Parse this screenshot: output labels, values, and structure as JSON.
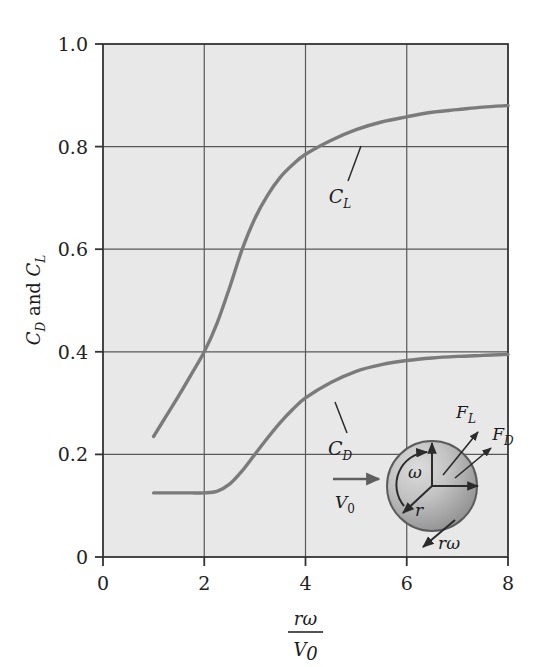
{
  "figure": {
    "background_color": "#ffffff",
    "plot_fill_color": "#e8e8e8",
    "axis_color": "#3a3a3a",
    "grid_color": "#4a4a4a",
    "curve_color": "#7a7a7a",
    "text_color": "#1a1a1a"
  },
  "axes": {
    "y_label_parts": {
      "c": "C",
      "d_sub": "D",
      "and": " and ",
      "c2": "C",
      "l_sub": "L"
    },
    "y_label_text": "CD and CL",
    "x_label_numerator": "rω",
    "x_label_denominator": "V",
    "x_label_denominator_sub": "0",
    "x_label_text": "rω / V0",
    "x_ticks": [
      "0",
      "2",
      "4",
      "6",
      "8"
    ],
    "x_tick_values": [
      0,
      2,
      4,
      6,
      8
    ],
    "y_ticks": [
      "0",
      "0.2",
      "0.4",
      "0.6",
      "0.8",
      "1.0"
    ],
    "y_tick_values": [
      0,
      0.2,
      0.4,
      0.6,
      0.8,
      1.0
    ]
  },
  "curve_labels": {
    "lift": "C",
    "lift_sub": "L",
    "drag": "C",
    "drag_sub": "D"
  },
  "inset": {
    "name": "rotating-sphere-diagram",
    "freestream_label": "V",
    "freestream_sub": "0",
    "lift_force_label": "F",
    "lift_force_sub": "L",
    "drag_force_label": "F",
    "drag_force_sub": "D",
    "omega_label": "ω",
    "radius_label": "r",
    "tangential_label": "rω",
    "sphere_fill_light": "#d2d2d2",
    "sphere_fill_dark": "#8f8f8f"
  },
  "chart_data": {
    "type": "line",
    "title": "",
    "xlabel": "rω/V0",
    "ylabel": "CD and CL",
    "xlim": [
      0,
      8
    ],
    "ylim": [
      0,
      1.0
    ],
    "grid": true,
    "legend": "inline-labels",
    "x": [
      1.0,
      1.25,
      1.5,
      1.75,
      2.0,
      2.25,
      2.5,
      2.75,
      3.0,
      3.25,
      3.5,
      3.75,
      4.0,
      4.5,
      5.0,
      5.5,
      6.0,
      6.5,
      7.0,
      7.5,
      8.0
    ],
    "series": [
      {
        "name": "CL",
        "label": "C_L",
        "values": [
          0.235,
          0.275,
          0.315,
          0.357,
          0.4,
          0.455,
          0.525,
          0.6,
          0.66,
          0.705,
          0.74,
          0.765,
          0.785,
          0.812,
          0.833,
          0.848,
          0.858,
          0.867,
          0.872,
          0.877,
          0.88
        ]
      },
      {
        "name": "CD",
        "label": "C_D",
        "values": [
          0.125,
          0.125,
          0.125,
          0.125,
          0.125,
          0.128,
          0.142,
          0.168,
          0.2,
          0.232,
          0.262,
          0.288,
          0.31,
          0.34,
          0.362,
          0.375,
          0.383,
          0.388,
          0.391,
          0.393,
          0.395
        ]
      }
    ]
  }
}
